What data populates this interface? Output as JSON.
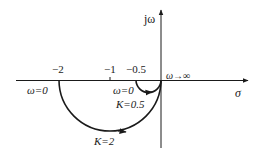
{
  "diagram": {
    "type": "nyquist-plot",
    "axes": {
      "imag_label": "jω",
      "real_label": "σ"
    },
    "ticks": [
      {
        "label": "−2",
        "value": -2
      },
      {
        "label": "−1",
        "value": -1
      },
      {
        "label": "−0.5",
        "value": -0.5
      }
    ],
    "annotations": {
      "omega_inf": "ω→∞",
      "omega_zero_large": "ω=0",
      "omega_zero_small": "ω=0",
      "k_small": "K=0.5",
      "k_large": "K=2"
    },
    "curves": [
      {
        "name": "K=0.5",
        "start": -0.5,
        "end": 0
      },
      {
        "name": "K=2",
        "start": -2,
        "end": 0
      }
    ],
    "colors": {
      "stroke": "#1a1a1a",
      "background": "#ffffff"
    }
  }
}
